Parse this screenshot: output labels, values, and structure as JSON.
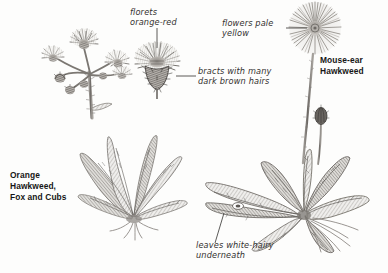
{
  "plate": {
    "background_color": "#fdfdfc",
    "ink_color": "#55514d",
    "label_color": "#2b2b2b"
  },
  "labels": {
    "florets": "florets\norange-red",
    "bracts": "bracts with many\ndark brown hairs",
    "flowers_pale": "flowers pale\nyellow",
    "leaves_hairy": "leaves white-hairy\nunderneath",
    "orange_hawkweed": "Orange\nHawkweed,\nFox and Cubs",
    "mouse_ear_hawkweed": "Mouse-ear\nHawkweed"
  },
  "specimens": [
    {
      "name": "Orange Hawkweed, Fox and Cubs",
      "parts": [
        "flower cluster",
        "basal leaf rosette",
        "roots"
      ]
    },
    {
      "name": "Mouse-ear Hawkweed",
      "parts": [
        "flower head",
        "bud",
        "stem",
        "basal leaf rosette",
        "runner"
      ]
    }
  ],
  "details": [
    {
      "name": "flower head detail",
      "callouts": [
        "florets orange-red",
        "bracts with many dark brown hairs"
      ]
    }
  ]
}
